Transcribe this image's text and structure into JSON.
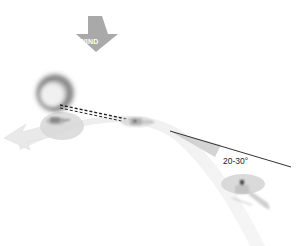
{
  "diagram": {
    "wind_label": "WIND",
    "angle_label": "20-30°",
    "elements": [
      {
        "name": "wind-arrow",
        "meaning": "wind direction, pointing down"
      },
      {
        "name": "fire-smoke",
        "meaning": "fire / smoke cloud"
      },
      {
        "name": "helicopter-drop",
        "meaning": "helicopter over fire dropping load"
      },
      {
        "name": "helicopter-approach",
        "meaning": "helicopter on approach path"
      },
      {
        "name": "helicopter-start",
        "meaning": "helicopter at start of approach"
      },
      {
        "name": "approach-path",
        "meaning": "curved flight path"
      },
      {
        "name": "exit-arrow",
        "meaning": "departure direction"
      },
      {
        "name": "sightline",
        "meaning": "dashed line of sight to fire"
      },
      {
        "name": "angle-reference-line",
        "meaning": "reference line showing 20-30 degree offset"
      }
    ],
    "colors": {
      "wind_arrow": "#a8a8a8",
      "shadow": "#d9d9d9",
      "path": "#ececec",
      "smoke": "#777777",
      "line": "#333333"
    }
  }
}
